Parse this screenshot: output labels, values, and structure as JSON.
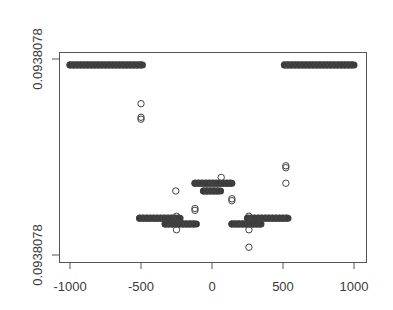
{
  "chart_data": {
    "type": "scatter",
    "title": "",
    "xlabel": "",
    "ylabel": "",
    "xlim": [
      -1080,
      1080
    ],
    "x_ticks": [
      -1000,
      -500,
      0,
      500,
      1000
    ],
    "x_tick_labels": [
      "-1000",
      "-500",
      "0",
      "500",
      "1000"
    ],
    "y_ticks_labels": [
      "0.0938078",
      "0.0938078"
    ],
    "y_note": "Both y tick labels display the same rounded value 0.0938078; relative levels expressed as fraction of y-range (0=bottom tick, 1=top tick).",
    "ylim_relative": [
      0,
      1
    ],
    "grid": false,
    "legend": null,
    "marker": "open circle",
    "series": [
      {
        "name": "top-left band",
        "x_range": [
          -1000,
          -490
        ],
        "y_rel": 0.98,
        "dense": true
      },
      {
        "name": "top-right band",
        "x_range": [
          510,
          1000
        ],
        "y_rel": 0.98,
        "dense": true
      },
      {
        "name": "low-left band upper",
        "x_range": [
          -510,
          -225
        ],
        "y_rel": 0.19,
        "dense": true
      },
      {
        "name": "low-left band lower",
        "x_range": [
          -330,
          -110
        ],
        "y_rel": 0.16,
        "dense": true
      },
      {
        "name": "low-right band lower",
        "x_range": [
          140,
          345
        ],
        "y_rel": 0.16,
        "dense": true
      },
      {
        "name": "low-right band upper",
        "x_range": [
          250,
          535
        ],
        "y_rel": 0.19,
        "dense": true
      },
      {
        "name": "middle cluster upper",
        "x_range": [
          -120,
          140
        ],
        "y_rel": 0.37,
        "dense": true
      },
      {
        "name": "middle cluster lower",
        "x_range": [
          -60,
          60
        ],
        "y_rel": 0.33,
        "dense": true
      },
      {
        "name": "outliers",
        "points": [
          [
            -500,
            0.78
          ],
          [
            -500,
            0.71
          ],
          [
            -500,
            0.7
          ],
          [
            -255,
            0.33
          ],
          [
            -250,
            0.2
          ],
          [
            -250,
            0.13
          ],
          [
            -120,
            0.24
          ],
          [
            -120,
            0.23
          ],
          [
            65,
            0.4
          ],
          [
            140,
            0.29
          ],
          [
            140,
            0.28
          ],
          [
            260,
            0.2
          ],
          [
            260,
            0.13
          ],
          [
            260,
            0.04
          ],
          [
            520,
            0.46
          ],
          [
            520,
            0.45
          ],
          [
            520,
            0.37
          ]
        ]
      }
    ]
  },
  "axes": {
    "x_labels": [
      "-1000",
      "-500",
      "0",
      "500",
      "1000"
    ],
    "y_top_label": "0.0938078",
    "y_bottom_label": "0.0938078"
  }
}
